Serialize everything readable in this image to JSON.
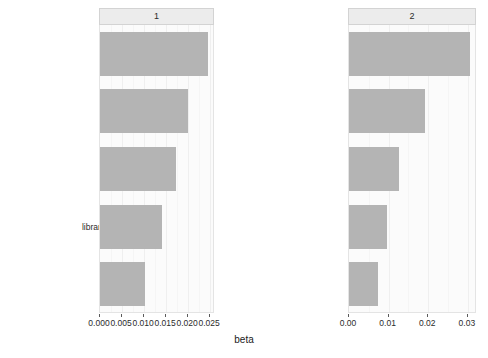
{
  "chart_data": {
    "type": "bar",
    "title": "",
    "xlabel": "beta",
    "ylabel": "term",
    "orientation": "horizontal",
    "facets": [
      {
        "label": "1",
        "xlim": [
          0.0,
          0.0261
        ],
        "xticks": [
          0.0,
          0.005,
          0.01,
          0.015,
          0.02,
          0.025
        ],
        "xticklabels": [
          "0.000",
          "0.005",
          "0.010",
          "0.015",
          "0.020",
          "0.025"
        ],
        "categories": [
          "academic libraries",
          "information literacy",
          "public libraries",
          "university libraries",
          "library services"
        ],
        "values": [
          0.0245,
          0.02,
          0.0173,
          0.0141,
          0.0102
        ]
      },
      {
        "label": "2",
        "xlim": [
          0.0,
          0.0323
        ],
        "xticks": [
          0.0,
          0.01,
          0.02,
          0.03
        ],
        "xticklabels": [
          "0.00",
          "0.01",
          "0.02",
          "0.03"
        ],
        "categories": [
          "academic libraries",
          "libraries",
          "public libraries",
          "library and information science",
          "digital libraries"
        ],
        "values": [
          0.0305,
          0.0192,
          0.0126,
          0.0096,
          0.0073
        ]
      }
    ],
    "bar_color": "#b4b4b4",
    "panel_background": "#fbfbfb",
    "strip_background": "#ececec",
    "grid": true,
    "legend": "none"
  }
}
